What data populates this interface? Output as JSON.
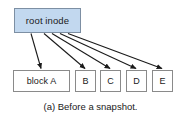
{
  "figure": {
    "caption": "(a) Before a snapshot.",
    "colors": {
      "root_fill": "#c2d8ef",
      "root_border": "#7d8fa3",
      "node_fill": "#ffffff",
      "node_border": "#8a8a8a",
      "arrow": "#1a1a1a",
      "text": "#1a1a1a",
      "background": "#ffffff"
    },
    "root": {
      "label": "root inode"
    },
    "blocks": [
      {
        "label": "block A"
      },
      {
        "label": "B"
      },
      {
        "label": "C"
      },
      {
        "label": "D"
      },
      {
        "label": "E"
      }
    ],
    "arrows": [
      {
        "from": "root inode",
        "to": "block A"
      },
      {
        "from": "root inode",
        "to": "B"
      },
      {
        "from": "root inode",
        "to": "C"
      },
      {
        "from": "root inode",
        "to": "D"
      },
      {
        "from": "root inode",
        "to": "E"
      }
    ]
  }
}
